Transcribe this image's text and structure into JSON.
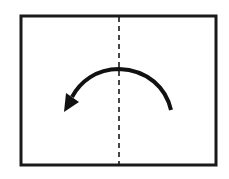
{
  "diagram": {
    "type": "fold-instruction",
    "paper": {
      "x": 20,
      "y": 15,
      "width": 197,
      "height": 151,
      "stroke": "#1a1a1a",
      "stroke_width": 3,
      "fill": "#ffffff"
    },
    "fold_line": {
      "style": "dashed",
      "x": 119,
      "y1": 15,
      "y2": 166,
      "color": "#1a1a1a"
    },
    "arrow": {
      "direction": "right-to-left",
      "start": [
        171,
        110
      ],
      "apex": [
        119,
        69
      ],
      "end": [
        64,
        112
      ],
      "color": "#111111"
    },
    "colors": {
      "background": "#ffffff",
      "ink": "#1a1a1a"
    }
  }
}
